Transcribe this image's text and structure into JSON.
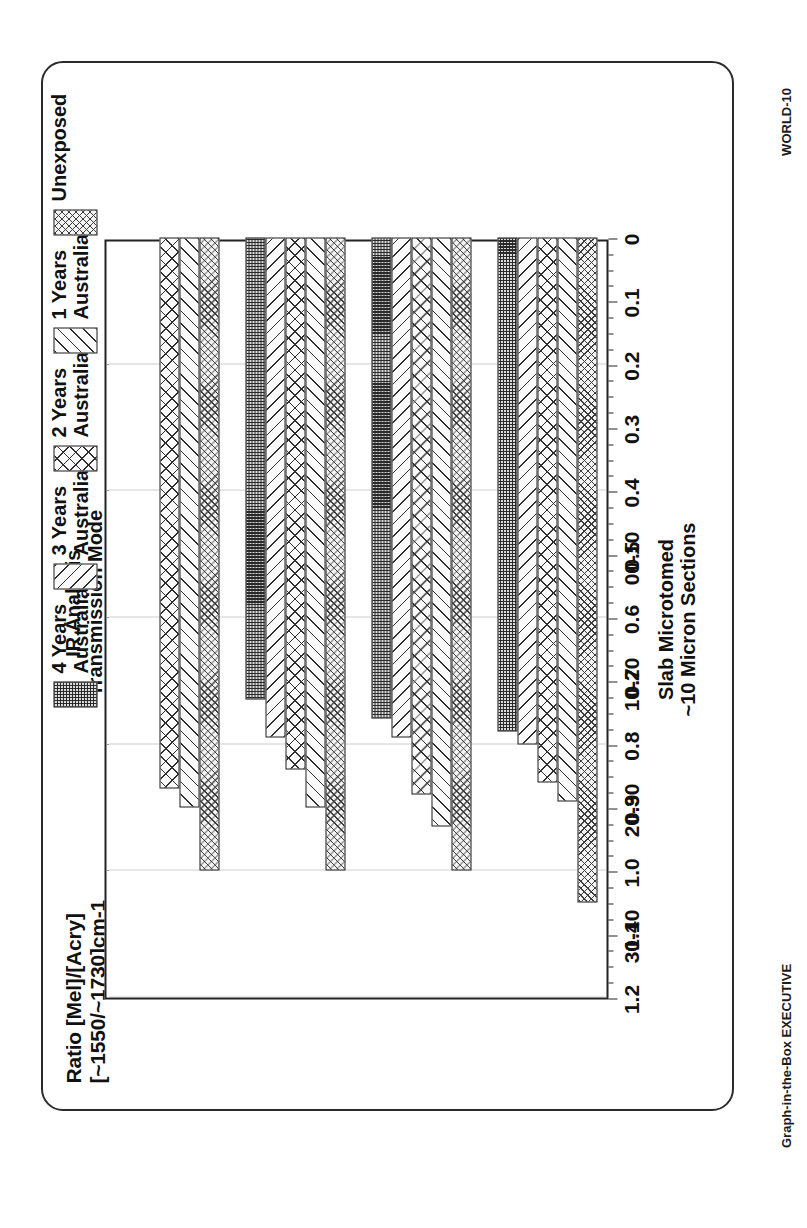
{
  "corner_tags": {
    "top_right": "WORLD-10",
    "bottom_right": "Graph-in-the-Box EXECUTIVE"
  },
  "titles": {
    "value_axis_line1": "Ratio [Mel]/[Acry]",
    "value_axis_line2": "[~1550/~1730]cm-1",
    "top_line1": "IR Analysis",
    "top_line2": "Transmission Mode",
    "category_axis_line1": "Slab Microtomed",
    "category_axis_line2": "~10 Micron Sections"
  },
  "legend": {
    "items": [
      {
        "label_line1": "4 Years",
        "label_line2": "Australia",
        "pattern": "p-y4",
        "swatch_name": "legend-swatch-4-years"
      },
      {
        "label_line1": "3 Years",
        "label_line2": "Australia",
        "pattern": "p-y3",
        "swatch_name": "legend-swatch-3-years"
      },
      {
        "label_line1": "2 Years",
        "label_line2": "Australia",
        "pattern": "p-y2",
        "swatch_name": "legend-swatch-2-years"
      },
      {
        "label_line1": "1 Years",
        "label_line2": "Australia",
        "pattern": "p-y1",
        "swatch_name": "legend-swatch-1-years"
      },
      {
        "label_line1": "Unexposed",
        "label_line2": "",
        "pattern": "p-unexposed",
        "swatch_name": "legend-swatch-unexposed"
      }
    ]
  },
  "chart_data": {
    "type": "bar",
    "orientation": "horizontal",
    "title": "IR Analysis\nTransmission Mode",
    "xlabel": "Slab Microtomed\n~10 Micron Sections",
    "ylabel": "Ratio [Mel]/[Acry]\n[~1550/~1730]cm-1",
    "categories": [
      "00-10",
      "10-20",
      "20-30",
      "30-40"
    ],
    "ylim": [
      0,
      1.2
    ],
    "ytick_labels": [
      "0",
      "0.1",
      "0.2",
      "0.3",
      "0.4",
      "0.5",
      "0.6",
      "0.7",
      "0.8",
      "0.9",
      "1.0",
      "1.1",
      "1.2"
    ],
    "ytick_values": [
      0,
      0.1,
      0.2,
      0.3,
      0.4,
      0.5,
      0.6,
      0.7,
      0.8,
      0.9,
      1.0,
      1.1,
      1.2
    ],
    "grid": true,
    "grid_axis": "value",
    "gridline_values": [
      0.2,
      0.4,
      0.6,
      0.8,
      1.0,
      1.2
    ],
    "legend_position": "top",
    "series": [
      {
        "name": "Unexposed",
        "pattern": "p-unexposed",
        "values": [
          1.05,
          1.0,
          1.0,
          1.0
        ]
      },
      {
        "name": "1 Years Australia",
        "pattern": "p-y1",
        "values": [
          0.89,
          0.93,
          0.9,
          0.9
        ]
      },
      {
        "name": "2 Years Australia",
        "pattern": "p-y2",
        "values": [
          0.86,
          0.88,
          0.84,
          0.87
        ]
      },
      {
        "name": "3 Years Australia",
        "pattern": "p-y3",
        "values": [
          0.8,
          0.79,
          0.79,
          0.0
        ]
      },
      {
        "name": "4 Years Australia",
        "pattern": "p-y4",
        "values": [
          0.78,
          0.76,
          0.73,
          0.0
        ]
      }
    ]
  }
}
